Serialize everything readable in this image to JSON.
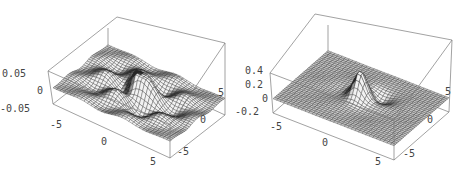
{
  "chart_data": [
    {
      "type": "surface3d",
      "title": "",
      "xlabel": "",
      "ylabel": "",
      "zlabel": "",
      "x_range": [
        -6,
        6
      ],
      "y_range": [
        -6,
        6
      ],
      "z_range": [
        -0.07,
        0.07
      ],
      "x_ticks": [
        "-5",
        "0",
        "5"
      ],
      "y_ticks": [
        "-5",
        "0",
        "5"
      ],
      "z_ticks": [
        "0.05",
        "0",
        "-0.05"
      ],
      "description": "Oscillating surface with several peaks and valleys; tallest ridges near origin, clipped at box top",
      "mesh": "wireframe grid shaded gray",
      "box": true
    },
    {
      "type": "surface3d",
      "title": "",
      "xlabel": "",
      "ylabel": "",
      "zlabel": "",
      "x_range": [
        -6,
        6
      ],
      "y_range": [
        -6,
        6
      ],
      "z_range": [
        -0.25,
        0.45
      ],
      "x_ticks": [
        "-5",
        "0",
        "5"
      ],
      "y_ticks": [
        "-5",
        "0",
        "5"
      ],
      "z_ticks": [
        "0.4",
        "0.2",
        "0",
        "-0.2"
      ],
      "description": "Single central peak around origin (~0.4) with a small dip beside it, flat elsewhere",
      "mesh": "wireframe grid shaded gray",
      "box": true
    }
  ],
  "plots": [
    {
      "id": "left",
      "offset_x": 0,
      "corners": {
        "top_back": [
          117,
          17
        ],
        "top_right": [
          225,
          43
        ],
        "top_left": [
          48,
          71
        ],
        "bottom_left": [
          53,
          104
        ],
        "bottom_front": [
          170,
          158
        ],
        "bottom_right": [
          225,
          115
        ]
      },
      "z_labels": [
        {
          "text": "0.05",
          "x": 2,
          "y": 77
        },
        {
          "text": "0",
          "x": 37,
          "y": 94
        },
        {
          "text": "-0.05",
          "x": 0,
          "y": 112
        }
      ],
      "x_labels": [
        {
          "text": "-5",
          "x": 50,
          "y": 128
        },
        {
          "text": "0",
          "x": 101,
          "y": 145
        },
        {
          "text": "5",
          "x": 150,
          "y": 165
        }
      ],
      "y_labels": [
        {
          "text": "5",
          "x": 218,
          "y": 96
        },
        {
          "text": "0",
          "x": 200,
          "y": 123
        },
        {
          "text": "-5",
          "x": 177,
          "y": 155
        }
      ]
    },
    {
      "id": "right",
      "offset_x": 235,
      "corners": {
        "top_back": [
          80,
          14
        ],
        "top_right": [
          217,
          40
        ],
        "top_left": [
          35,
          73
        ],
        "bottom_left": [
          38,
          113
        ],
        "bottom_front": [
          159,
          160
        ],
        "bottom_right": [
          214,
          112
        ]
      },
      "z_labels": [
        {
          "text": "0.4",
          "x": 10,
          "y": 74
        },
        {
          "text": "0.2",
          "x": 10,
          "y": 88
        },
        {
          "text": "0",
          "x": 27,
          "y": 102
        },
        {
          "text": "-0.2",
          "x": 0,
          "y": 115
        }
      ],
      "x_labels": [
        {
          "text": "-5",
          "x": 35,
          "y": 130
        },
        {
          "text": "0",
          "x": 87,
          "y": 146
        },
        {
          "text": "5",
          "x": 140,
          "y": 165
        }
      ],
      "y_labels": [
        {
          "text": "5",
          "x": 210,
          "y": 95
        },
        {
          "text": "0",
          "x": 192,
          "y": 123
        },
        {
          "text": "-5",
          "x": 168,
          "y": 157
        }
      ]
    }
  ]
}
